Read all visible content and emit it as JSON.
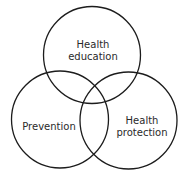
{
  "diagram": {
    "type": "venn",
    "stroke_color": "#1c1c1c",
    "text_color": "#2a2a2a",
    "sets": [
      {
        "id": "health-education",
        "label_lines": [
          "Health",
          "education"
        ],
        "cx": 92,
        "cy": 55,
        "r": 48.5,
        "label_x": 93,
        "label_y1": 45,
        "label_y2": 57
      },
      {
        "id": "prevention",
        "label_lines": [
          "Prevention"
        ],
        "cx": 60,
        "cy": 119.5,
        "r": 48.5,
        "label_x": 49,
        "label_y1": 127
      },
      {
        "id": "health-protection",
        "label_lines": [
          "Health",
          "protection"
        ],
        "cx": 128.5,
        "cy": 120.5,
        "r": 48.5,
        "label_x": 142,
        "label_y1": 121,
        "label_y2": 133
      }
    ]
  }
}
